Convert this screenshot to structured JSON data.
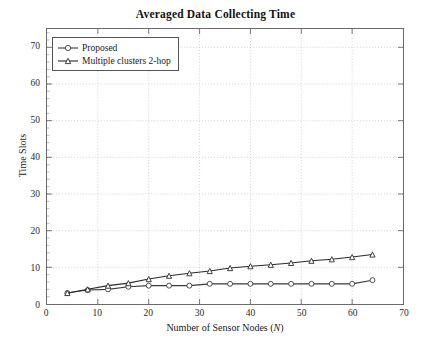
{
  "chart_data": {
    "type": "line",
    "title": "Averaged Data Collecting Time",
    "xlabel": "Number of Sensor Nodes (N)",
    "xlabel_plain": "Number of Sensor Nodes (",
    "xlabel_italic": "N",
    "xlabel_tail": ")",
    "ylabel": "Time Slots",
    "xlim": [
      0,
      70
    ],
    "ylim": [
      0,
      75
    ],
    "xticks": [
      0,
      10,
      20,
      30,
      40,
      50,
      60,
      70
    ],
    "yticks": [
      0,
      10,
      20,
      30,
      40,
      50,
      60,
      70
    ],
    "grid": "dotted-both-axes",
    "legend_position": "top-left-inside",
    "x": [
      4,
      8,
      12,
      16,
      20,
      24,
      28,
      32,
      36,
      40,
      44,
      48,
      52,
      56,
      60,
      64
    ],
    "series": [
      {
        "name": "Proposed",
        "marker": "open-circle",
        "color": "#3a3a3a",
        "values": [
          3.0,
          3.8,
          4.0,
          4.7,
          5.0,
          5.0,
          5.0,
          5.5,
          5.5,
          5.5,
          5.5,
          5.5,
          5.5,
          5.5,
          5.5,
          6.5
        ]
      },
      {
        "name": "Multiple clusters 2-hop",
        "marker": "filled-triangle",
        "color": "#2b2b2b",
        "values": [
          3.0,
          4.0,
          5.0,
          5.7,
          6.8,
          7.7,
          8.4,
          9.0,
          9.8,
          10.3,
          10.7,
          11.2,
          11.8,
          12.2,
          12.8,
          13.5
        ]
      }
    ]
  }
}
